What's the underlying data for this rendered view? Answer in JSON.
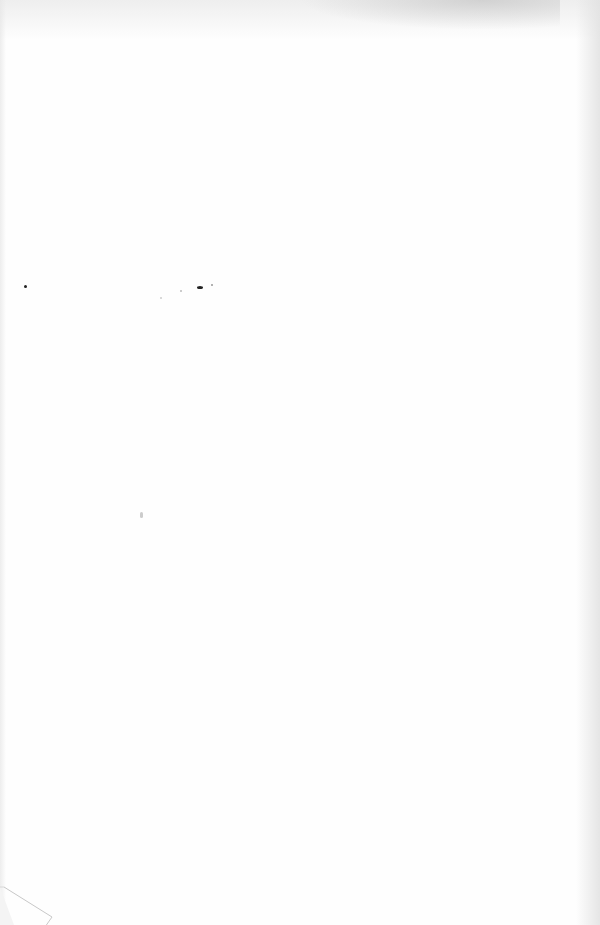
{
  "document": {
    "type": "blank scanned page",
    "text_content": ""
  }
}
